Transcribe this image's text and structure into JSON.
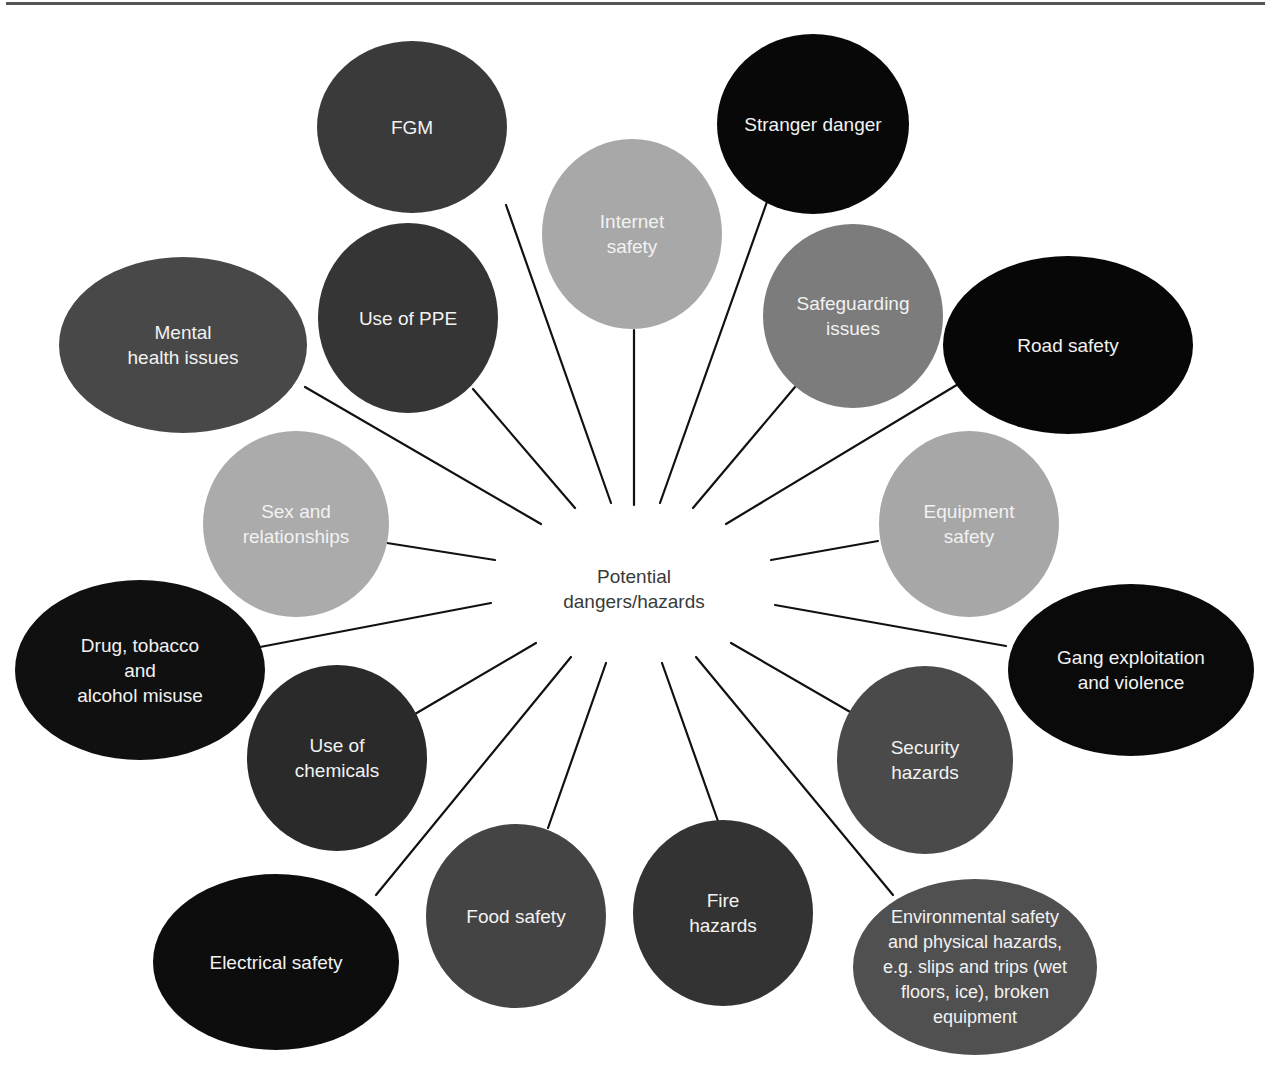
{
  "diagram": {
    "center": {
      "label": "Potential\ndangers/hazards",
      "x": 634,
      "y": 589
    },
    "colors": {
      "black": "#0d0d0d",
      "dark": "#333333",
      "mid_dark": "#454545",
      "mid": "#7a7a7a",
      "light": "#a9a9a9",
      "line": "#111111",
      "text_on_bubble": "#f2f2f2",
      "center_text": "#3a3a3a"
    },
    "nodes": [
      {
        "id": "fgm",
        "label": "FGM",
        "cx": 412,
        "cy": 127,
        "rx": 95,
        "ry": 86,
        "fill": "#3a3a3a",
        "line": [
          [
            506,
            205
          ],
          [
            611,
            503
          ]
        ]
      },
      {
        "id": "stranger-danger",
        "label": "Stranger danger",
        "cx": 813,
        "cy": 124,
        "rx": 96,
        "ry": 90,
        "fill": "#080808",
        "line": [
          [
            768,
            199
          ],
          [
            660,
            503
          ]
        ]
      },
      {
        "id": "internet-safety",
        "label": "Internet\nsafety",
        "cx": 632,
        "cy": 234,
        "rx": 90,
        "ry": 95,
        "fill": "#a8a8a8",
        "line": [
          [
            634,
            330
          ],
          [
            634,
            505
          ]
        ]
      },
      {
        "id": "use-of-ppe",
        "label": "Use of PPE",
        "cx": 408,
        "cy": 318,
        "rx": 90,
        "ry": 95,
        "fill": "#353535",
        "line": [
          [
            473,
            389
          ],
          [
            575,
            508
          ]
        ]
      },
      {
        "id": "safeguarding-issues",
        "label": "Safeguarding\nissues",
        "cx": 853,
        "cy": 316,
        "rx": 90,
        "ry": 92,
        "fill": "#7c7c7c",
        "line": [
          [
            795,
            387
          ],
          [
            693,
            508
          ]
        ]
      },
      {
        "id": "mental-health",
        "label": "Mental\nhealth issues",
        "cx": 183,
        "cy": 345,
        "rx": 124,
        "ry": 88,
        "fill": "#484848",
        "line": [
          [
            305,
            387
          ],
          [
            541,
            524
          ]
        ]
      },
      {
        "id": "road-safety",
        "label": "Road safety",
        "cx": 1068,
        "cy": 345,
        "rx": 125,
        "ry": 89,
        "fill": "#070707",
        "line": [
          [
            960,
            383
          ],
          [
            726,
            524
          ]
        ]
      },
      {
        "id": "sex-relationships",
        "label": "Sex and\nrelationships",
        "cx": 296,
        "cy": 524,
        "rx": 93,
        "ry": 93,
        "fill": "#ababab",
        "line": [
          [
            387,
            543
          ],
          [
            495,
            560
          ]
        ]
      },
      {
        "id": "equipment-safety",
        "label": "Equipment\nsafety",
        "cx": 969,
        "cy": 524,
        "rx": 90,
        "ry": 93,
        "fill": "#a7a7a7",
        "line": [
          [
            878,
            541
          ],
          [
            771,
            560
          ]
        ]
      },
      {
        "id": "drug-tobacco-alcohol",
        "label": "Drug, tobacco\nand\nalcohol misuse",
        "cx": 140,
        "cy": 670,
        "rx": 125,
        "ry": 90,
        "fill": "#101010",
        "line": [
          [
            260,
            647
          ],
          [
            491,
            603
          ]
        ]
      },
      {
        "id": "gang-exploitation",
        "label": "Gang exploitation\nand violence",
        "cx": 1131,
        "cy": 670,
        "rx": 123,
        "ry": 86,
        "fill": "#0a0a0a",
        "line": [
          [
            1006,
            646
          ],
          [
            775,
            605
          ]
        ]
      },
      {
        "id": "use-of-chemicals",
        "label": "Use of\nchemicals",
        "cx": 337,
        "cy": 758,
        "rx": 90,
        "ry": 93,
        "fill": "#2a2a2a",
        "line": [
          [
            415,
            714
          ],
          [
            536,
            643
          ]
        ]
      },
      {
        "id": "security-hazards",
        "label": "Security\nhazards",
        "cx": 925,
        "cy": 760,
        "rx": 88,
        "ry": 94,
        "fill": "#4a4a4a",
        "line": [
          [
            852,
            713
          ],
          [
            731,
            643
          ]
        ]
      },
      {
        "id": "electrical-safety",
        "label": "Electrical safety",
        "cx": 276,
        "cy": 962,
        "rx": 123,
        "ry": 88,
        "fill": "#0d0d0d",
        "line": [
          [
            376,
            895
          ],
          [
            571,
            657
          ]
        ]
      },
      {
        "id": "food-safety",
        "label": "Food safety",
        "cx": 516,
        "cy": 916,
        "rx": 90,
        "ry": 92,
        "fill": "#444444",
        "line": [
          [
            548,
            828
          ],
          [
            606,
            663
          ]
        ]
      },
      {
        "id": "fire-hazards",
        "label": "Fire\nhazards",
        "cx": 723,
        "cy": 913,
        "rx": 90,
        "ry": 93,
        "fill": "#333333",
        "line": [
          [
            719,
            824
          ],
          [
            662,
            663
          ]
        ]
      },
      {
        "id": "environmental-safety",
        "label": "Environmental safety\nand physical hazards,\ne.g. slips and trips (wet\nfloors, ice), broken\nequipment",
        "cx": 975,
        "cy": 967,
        "rx": 122,
        "ry": 88,
        "fill": "#505050",
        "line": [
          [
            893,
            895
          ],
          [
            696,
            657
          ]
        ]
      }
    ]
  }
}
